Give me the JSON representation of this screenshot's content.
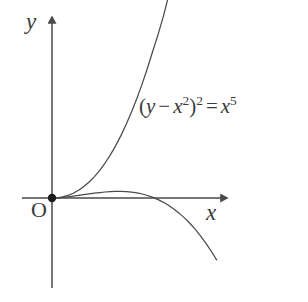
{
  "figure": {
    "background_color": "#ffffff",
    "stroke_color": "#4a4a4a",
    "width": 308,
    "height": 302
  },
  "axes": {
    "x_label": "x",
    "y_label": "y",
    "origin_label": "O",
    "origin_point": {
      "x": 52,
      "y": 198
    },
    "x_axis": {
      "start_x": 22,
      "end_x": 228,
      "y": 198
    },
    "y_axis": {
      "x": 52,
      "start_y": 16,
      "end_y": 288
    },
    "arrow_x_tip": {
      "x": 228,
      "y": 198
    },
    "arrow_y_tip": {
      "x": 52,
      "y": 16
    },
    "ticks": [],
    "grid": false
  },
  "equation": {
    "display": "(y - x^2)^2 = x^5",
    "open_paren": "(",
    "y_symbol": "y",
    "minus": "−",
    "x_symbol": "x",
    "x_inner_exponent": "2",
    "close_paren": ")",
    "outer_exponent": "2",
    "equals": "=",
    "rhs_symbol": "x",
    "rhs_exponent": "5"
  },
  "chart_data": {
    "type": "line",
    "title": "",
    "subtitle": "",
    "xlabel": "x",
    "ylabel": "y",
    "annotations": [
      {
        "text": "(y - x^2)^2 = x^5",
        "x_px": 139,
        "y_px": 96
      },
      {
        "text": "O",
        "x_px": 40,
        "y_px": 212
      }
    ],
    "legend": [],
    "legend_position": "none",
    "grid": false,
    "xlim": [
      -0.22,
      1.72
    ],
    "ylim": [
      -1.78,
      1.54
    ],
    "curve_description": "Ramphoid cusp of the quintic curve (y - x^2)^2 = x^5, equivalent to the two branches y = x^2 + x^(5/2) (upper) and y = x^2 - x^(5/2) (lower), defined for x >= 0. Both branches leave the origin tangent to the x-axis.",
    "series": [
      {
        "name": "upper branch: y = x^2 + x^(5/2)",
        "x": [
          0,
          0.05,
          0.1,
          0.15,
          0.2,
          0.25,
          0.3,
          0.35,
          0.4,
          0.45,
          0.5,
          0.55,
          0.6,
          0.65,
          0.7,
          0.75,
          0.8,
          0.85,
          0.9,
          0.95,
          1.0,
          1.05,
          1.1,
          1.15
        ],
        "y": [
          0,
          0.00309,
          0.01316,
          0.03121,
          0.05789,
          0.09375,
          0.1393,
          0.19499,
          0.26119,
          0.3383,
          0.42678,
          0.52699,
          0.63934,
          0.76421,
          0.90197,
          1.053,
          1.21766,
          1.39632,
          1.5893,
          1.79698,
          2.0,
          2.22281,
          2.47927,
          2.74926
        ]
      },
      {
        "name": "lower branch: y = x^2 - x^(5/2)",
        "x": [
          0,
          0.05,
          0.1,
          0.15,
          0.2,
          0.25,
          0.3,
          0.35,
          0.4,
          0.45,
          0.5,
          0.55,
          0.6,
          0.65,
          0.7,
          0.75,
          0.8,
          0.85,
          0.9,
          0.95,
          1.0,
          1.05,
          1.1,
          1.15,
          1.2,
          1.25,
          1.3,
          1.35,
          1.4,
          1.45,
          1.5,
          1.55
        ],
        "y": [
          0,
          0.00191,
          0.00684,
          0.01379,
          0.02211,
          0.03125,
          0.0407,
          0.05001,
          0.05881,
          0.0667,
          0.07322,
          0.07801,
          0.08066,
          0.08079,
          0.07803,
          0.072,
          0.06234,
          0.04868,
          0.0307,
          0.00802,
          -0.0197,
          -0.05281,
          -0.09165,
          -0.13655,
          -0.18788,
          -0.24596,
          -0.31115,
          -0.3838,
          -0.46424,
          -0.55283,
          -0.64991,
          -0.75583
        ]
      }
    ]
  }
}
